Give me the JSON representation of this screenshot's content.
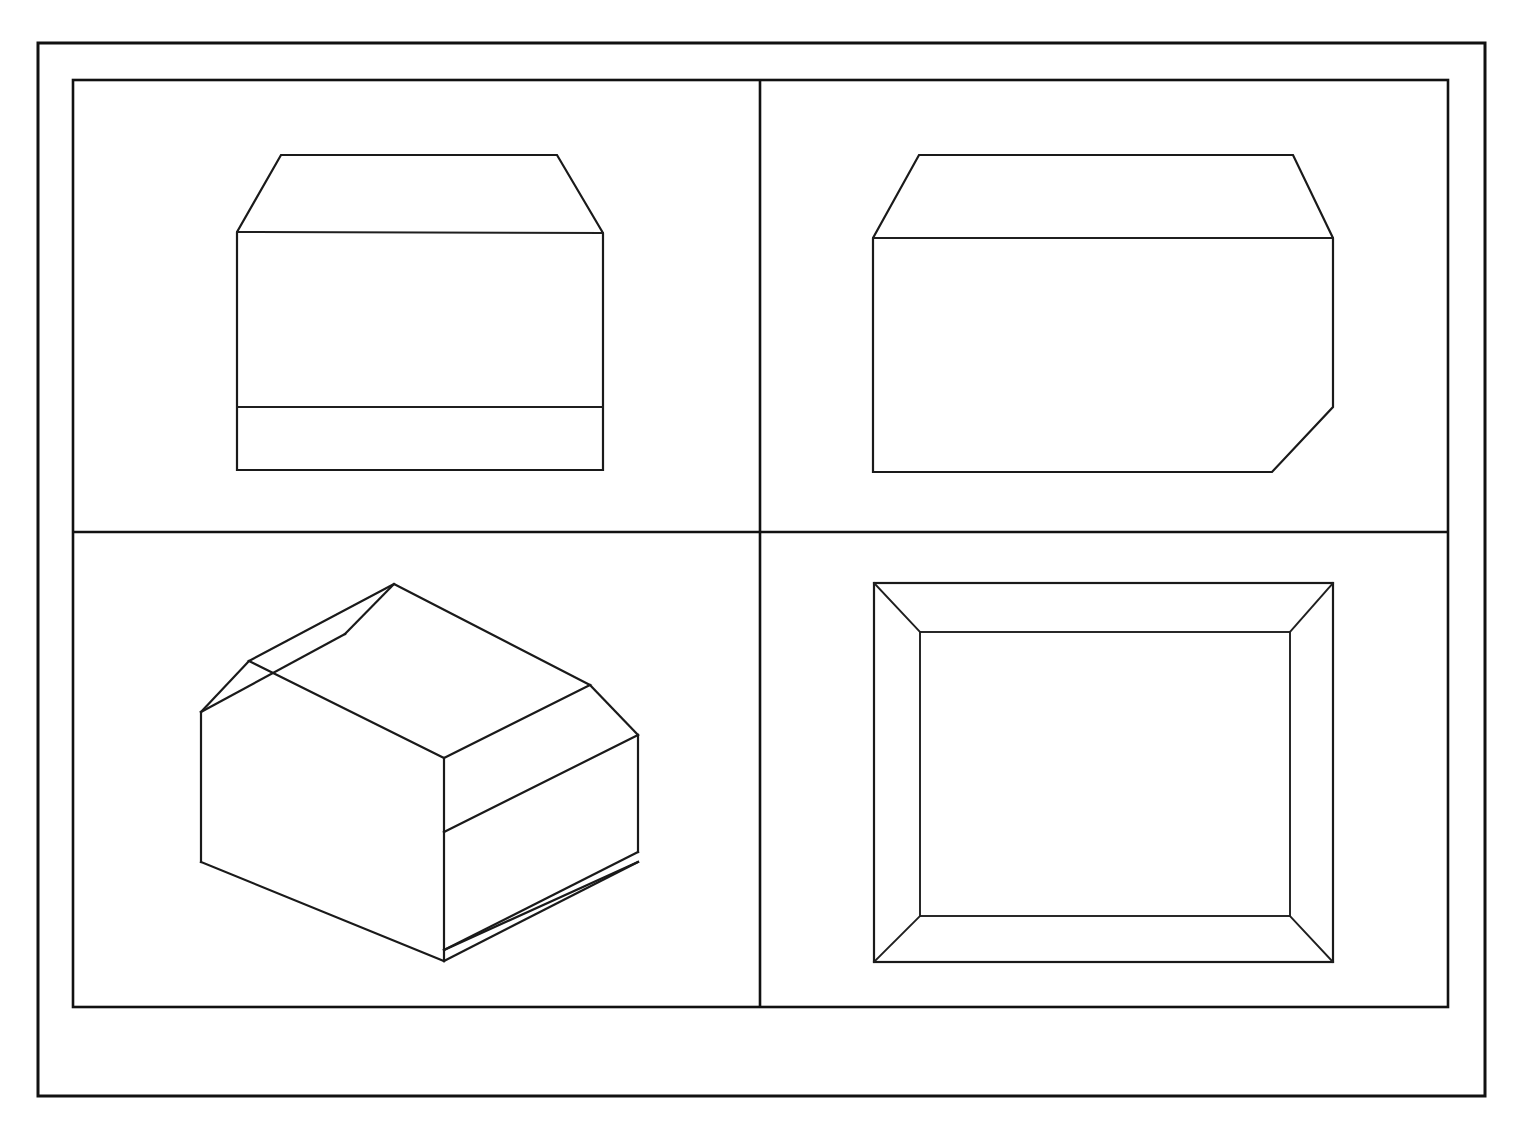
{
  "sheet": {
    "title": "",
    "background_color": "#ffffff",
    "line_color": "#1a1a1a",
    "width": 1519,
    "height": 1139,
    "border": {
      "outer": {
        "x": 38,
        "y": 43,
        "width": 1447,
        "height": 1053
      },
      "inner": {
        "x": 73,
        "y": 80,
        "width": 1375,
        "height": 927
      }
    },
    "dividers": {
      "vertical_x": 760,
      "horizontal_y": 532
    }
  },
  "drawing_type": "orthographic-projection-with-isometric",
  "panels": [
    {
      "id": "panel-top-left",
      "name": "front-view",
      "label": "",
      "quadrant": "top-left",
      "geometry": {
        "type": "polyline-outline",
        "description": "Rectangular front elevation with two symmetric top chamfers and a horizontal division line near the base",
        "outline": [
          [
            237,
            232
          ],
          [
            281,
            155
          ],
          [
            557,
            155
          ],
          [
            603,
            233
          ],
          [
            603,
            470
          ],
          [
            237,
            470
          ]
        ],
        "internal_lines": [
          [
            [
              237,
              232
            ],
            [
              603,
              233
            ]
          ],
          [
            [
              237,
              407
            ],
            [
              603,
              407
            ]
          ]
        ]
      }
    },
    {
      "id": "panel-top-right",
      "name": "side-view",
      "label": "",
      "quadrant": "top-right",
      "geometry": {
        "type": "polyline-outline",
        "description": "Rectangular side elevation with chamfers at top-left, top-right and bottom-right corners and a horizontal division line below the top",
        "outline": [
          [
            873,
            238
          ],
          [
            919,
            155
          ],
          [
            1293,
            155
          ],
          [
            1333,
            238
          ],
          [
            1333,
            407
          ],
          [
            1272,
            472
          ],
          [
            873,
            472
          ]
        ],
        "internal_lines": [
          [
            [
              873,
              238
            ],
            [
              1333,
              238
            ]
          ]
        ]
      }
    },
    {
      "id": "panel-bottom-left",
      "name": "isometric-view",
      "label": "",
      "quadrant": "bottom-left",
      "geometry": {
        "type": "isometric-solid",
        "description": "Isometric pictorial of a rectangular block with chamfered top edges, chamfered vertical corner and a narrow chamfer strip along the lower front-right edge",
        "top_face": [
          [
            394,
            584
          ],
          [
            590,
            685
          ],
          [
            444,
            758
          ],
          [
            249,
            661
          ]
        ],
        "top_left_chamfer": [
          [
            394,
            584
          ],
          [
            249,
            661
          ],
          [
            201,
            712
          ],
          [
            345,
            634
          ]
        ],
        "top_right_chamfer": [
          [
            590,
            685
          ],
          [
            638,
            735
          ],
          [
            444,
            832
          ],
          [
            444,
            758
          ]
        ],
        "left_chamfer_band": [
          [
            345,
            634
          ],
          [
            201,
            712
          ],
          [
            201,
            862
          ],
          [
            444,
            832
          ],
          [
            444,
            758
          ],
          [
            249,
            661
          ]
        ],
        "left_face": [
          [
            201,
            712
          ],
          [
            444,
            832
          ],
          [
            444,
            961
          ],
          [
            201,
            862
          ]
        ],
        "right_face": [
          [
            444,
            832
          ],
          [
            638,
            735
          ],
          [
            638,
            852
          ],
          [
            444,
            950
          ]
        ],
        "bottom_sliver": [
          [
            444,
            950
          ],
          [
            638,
            852
          ],
          [
            638,
            862
          ],
          [
            444,
            961
          ]
        ],
        "lines": [
          [
            [
              394,
              584
            ],
            [
              590,
              685
            ]
          ],
          [
            [
              590,
              685
            ],
            [
              444,
              758
            ]
          ],
          [
            [
              444,
              758
            ],
            [
              249,
              661
            ]
          ],
          [
            [
              249,
              661
            ],
            [
              394,
              584
            ]
          ],
          [
            [
              249,
              661
            ],
            [
              201,
              712
            ]
          ],
          [
            [
              394,
              584
            ],
            [
              345,
              634
            ]
          ],
          [
            [
              345,
              634
            ],
            [
              201,
              712
            ]
          ],
          [
            [
              590,
              685
            ],
            [
              638,
              735
            ]
          ],
          [
            [
              444,
              758
            ],
            [
              444,
              832
            ]
          ],
          [
            [
              638,
              735
            ],
            [
              444,
              832
            ]
          ],
          [
            [
              201,
              712
            ],
            [
              201,
              862
            ]
          ],
          [
            [
              201,
              862
            ],
            [
              444,
              961
            ]
          ],
          [
            [
              444,
              832
            ],
            [
              444,
              961
            ]
          ],
          [
            [
              638,
              735
            ],
            [
              638,
              852
            ]
          ],
          [
            [
              638,
              852
            ],
            [
              444,
              950
            ]
          ],
          [
            [
              444,
              950
            ],
            [
              444,
              961
            ]
          ],
          [
            [
              638,
              852
            ],
            [
              638,
              862
            ]
          ],
          [
            [
              638,
              862
            ],
            [
              444,
              961
            ]
          ]
        ]
      }
    },
    {
      "id": "panel-bottom-right",
      "name": "top-view",
      "label": "",
      "quadrant": "bottom-right",
      "geometry": {
        "type": "frame-with-mitres",
        "description": "Plan view drawn as a rectangle within a rectangle, joined by four mitre lines at the corners forming a bevelled frame",
        "outer_rect": [
          [
            874,
            583
          ],
          [
            1333,
            583
          ],
          [
            1333,
            962
          ],
          [
            874,
            962
          ]
        ],
        "inner_rect": [
          [
            920,
            632
          ],
          [
            1290,
            632
          ],
          [
            1290,
            916
          ],
          [
            920,
            916
          ]
        ],
        "mitre_lines": [
          [
            [
              874,
              583
            ],
            [
              920,
              632
            ]
          ],
          [
            [
              1333,
              583
            ],
            [
              1290,
              632
            ]
          ],
          [
            [
              1333,
              962
            ],
            [
              1290,
              916
            ]
          ],
          [
            [
              874,
              962
            ],
            [
              920,
              916
            ]
          ]
        ]
      }
    }
  ],
  "annotations": {
    "dimensions": [],
    "notes": [],
    "title_block": null
  }
}
